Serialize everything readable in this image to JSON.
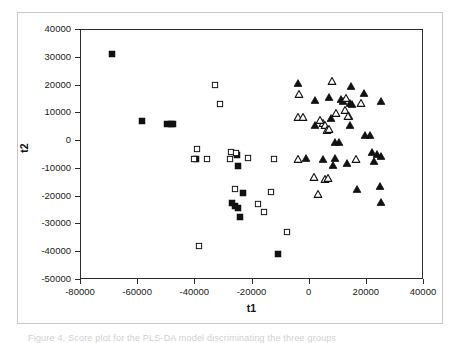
{
  "figure": {
    "caption_partial": "Figure 4. Score plot for the PLS-DA model discriminating the three groups",
    "frame_color": "#c9c9c9",
    "axis_color": "#2b2b2b",
    "marker_color": "#111111"
  },
  "chart_data": {
    "type": "scatter",
    "title": "",
    "xlabel": "t1",
    "ylabel": "t2",
    "xlim": [
      -80000,
      40000
    ],
    "ylim": [
      -50000,
      40000
    ],
    "xticks": [
      -80000,
      -60000,
      -40000,
      -20000,
      0,
      20000,
      40000
    ],
    "yticks": [
      40000,
      30000,
      20000,
      10000,
      0,
      -10000,
      -20000,
      -30000,
      -40000,
      -50000
    ],
    "xtick_labels": [
      "-80000",
      "-60000",
      "-40000",
      "-20000",
      "0",
      "20000",
      "40000"
    ],
    "ytick_labels": [
      "40000",
      "30000",
      "20000",
      "10000",
      "0",
      "-10000",
      "-20000",
      "-30000",
      "-40000",
      "-50000"
    ],
    "grid": false,
    "legend": "none",
    "series": [
      {
        "name": "filled-square",
        "marker": "square",
        "fill": "solid",
        "color": "#111111",
        "points": [
          [
            -69000,
            31500
          ],
          [
            -58500,
            7200
          ],
          [
            -50000,
            6300
          ],
          [
            -48600,
            6200
          ],
          [
            -47800,
            6000
          ],
          [
            -39600,
            -6300
          ],
          [
            -25400,
            -5000
          ],
          [
            -25200,
            -9000
          ],
          [
            -27200,
            -22400
          ],
          [
            -26000,
            -23500
          ],
          [
            -25200,
            -24200
          ],
          [
            -23200,
            -18800
          ],
          [
            -24200,
            -27300
          ],
          [
            -11200,
            -40500
          ]
        ]
      },
      {
        "name": "open-square",
        "marker": "square",
        "fill": "open",
        "color": "#111111",
        "points": [
          [
            -33000,
            20300
          ],
          [
            -31400,
            13200
          ],
          [
            -39400,
            -3000
          ],
          [
            -40600,
            -6400
          ],
          [
            -36000,
            -6300
          ],
          [
            -27600,
            -4000
          ],
          [
            -28000,
            -6500
          ],
          [
            -25800,
            -4400
          ],
          [
            -21400,
            -6100
          ],
          [
            -12600,
            -6300
          ],
          [
            -26200,
            -17200
          ],
          [
            -18200,
            -22500
          ],
          [
            -16000,
            -25400
          ],
          [
            -13600,
            -18200
          ],
          [
            -8000,
            -32800
          ],
          [
            -38600,
            -37700
          ]
        ]
      },
      {
        "name": "filled-triangle",
        "marker": "triangle",
        "fill": "solid",
        "color": "#111111",
        "points": [
          [
            -4200,
            21000
          ],
          [
            14500,
            20000
          ],
          [
            6800,
            16000
          ],
          [
            19000,
            17500
          ],
          [
            11000,
            15000
          ],
          [
            11800,
            14600
          ],
          [
            14000,
            13600
          ],
          [
            14800,
            13400
          ],
          [
            25000,
            14300
          ],
          [
            1800,
            14900
          ],
          [
            2000,
            5900
          ],
          [
            7500,
            8400
          ],
          [
            13800,
            9000
          ],
          [
            14000,
            5700
          ],
          [
            9000,
            -200
          ],
          [
            10200,
            -400
          ],
          [
            19200,
            2200
          ],
          [
            21000,
            2100
          ],
          [
            21800,
            -3900
          ],
          [
            23600,
            -4800
          ],
          [
            25000,
            -5400
          ],
          [
            8200,
            -8500
          ],
          [
            13000,
            -7800
          ],
          [
            22400,
            -7300
          ],
          [
            -1200,
            -6000
          ],
          [
            4500,
            -6500
          ],
          [
            16500,
            -17200
          ],
          [
            24500,
            -16000
          ],
          [
            25000,
            -22000
          ],
          [
            8800,
            -6200
          ]
        ]
      },
      {
        "name": "open-triangle",
        "marker": "triangle",
        "fill": "open",
        "color": "#111111",
        "points": [
          [
            7800,
            21800
          ],
          [
            -3800,
            16800
          ],
          [
            12600,
            15500
          ],
          [
            17800,
            13800
          ],
          [
            12400,
            11200
          ],
          [
            9200,
            10100
          ],
          [
            13400,
            9200
          ],
          [
            -4200,
            8600
          ],
          [
            -2200,
            8800
          ],
          [
            4500,
            6500
          ],
          [
            5200,
            5700
          ],
          [
            6000,
            4000
          ],
          [
            6600,
            4400
          ],
          [
            3500,
            7600
          ],
          [
            16200,
            -6400
          ],
          [
            -4000,
            -6300
          ],
          [
            1500,
            -13000
          ],
          [
            5500,
            -13600
          ],
          [
            6500,
            -13200
          ],
          [
            3000,
            -19200
          ]
        ]
      }
    ]
  }
}
